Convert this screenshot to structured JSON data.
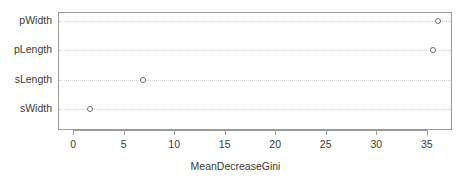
{
  "chart_data": {
    "type": "scatter",
    "title": "",
    "subtitle": "",
    "xlabel": "MeanDecreaseGini",
    "ylabel": "",
    "categories": [
      "sWidth",
      "sLength",
      "pLength",
      "pWidth"
    ],
    "values": [
      1.6,
      6.8,
      35.5,
      36.0
    ],
    "points": [
      {
        "category": "pWidth",
        "value": 36.0
      },
      {
        "category": "pLength",
        "value": 35.5
      },
      {
        "category": "sLength",
        "value": 6.8
      },
      {
        "category": "sWidth",
        "value": 1.6
      }
    ],
    "xlim": [
      -1.5,
      37.5
    ],
    "xticks": [
      0,
      5,
      10,
      15,
      20,
      25,
      30,
      35
    ],
    "xticklabels": [
      "0",
      "5",
      "10",
      "15",
      "20",
      "25",
      "30",
      "35"
    ],
    "grid": "horizontal-dotted",
    "legend": null,
    "marker": "open-circle",
    "marker_color": "#6f6f6f",
    "frame_color": "#9a9a9a",
    "grid_color": "#d2d2d2",
    "text_color": "#3a3a3a",
    "background": "#ffffff"
  },
  "axis": {
    "x_title": "MeanDecreaseGini",
    "tick_labels": [
      "0",
      "5",
      "10",
      "15",
      "20",
      "25",
      "30",
      "35"
    ],
    "category_labels": [
      "pWidth",
      "pLength",
      "sLength",
      "sWidth"
    ]
  }
}
